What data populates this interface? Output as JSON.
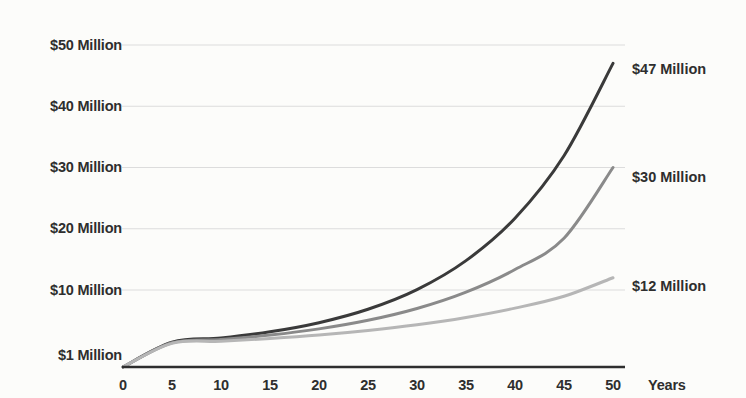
{
  "chart_data": {
    "type": "line",
    "title": "",
    "subtitle": "",
    "xlabel": "Years",
    "ylabel": "",
    "xlim": [
      0,
      50
    ],
    "ylim": [
      0,
      50
    ],
    "grid": true,
    "legend_position": "end-of-line",
    "x_ticks": [
      0,
      5,
      10,
      15,
      20,
      25,
      30,
      35,
      40,
      45,
      50
    ],
    "x_tick_labels": [
      "0",
      "5",
      "10",
      "15",
      "20",
      "25",
      "30",
      "35",
      "40",
      "45",
      "50"
    ],
    "y_ticks": [
      1,
      10,
      20,
      30,
      40,
      50
    ],
    "y_tick_labels": [
      "$1 Million",
      "$10 Million",
      "$20 Million",
      "$30 Million",
      "$40 Million",
      "$50 Million"
    ],
    "x": [
      0,
      5,
      10,
      15,
      20,
      25,
      30,
      35,
      40,
      45,
      50
    ],
    "series": [
      {
        "name": "$47 Million",
        "end_label": "$47 Million",
        "color": "#3a3a3a",
        "end_value": 47,
        "start_value": 1,
        "values": [
          1.0,
          1.47,
          2.16,
          3.17,
          4.66,
          6.85,
          10.06,
          14.79,
          21.72,
          31.92,
          47.0
        ]
      },
      {
        "name": "$30 Million",
        "end_label": "$30 Million",
        "color": "#8a8a8a",
        "end_value": 30,
        "start_value": 1,
        "values": [
          1.0,
          1.38,
          1.91,
          2.64,
          3.65,
          5.05,
          6.98,
          9.65,
          13.34,
          18.45,
          30.0
        ]
      },
      {
        "name": "$12 Million",
        "end_label": "$12 Million",
        "color": "#b6b6b6",
        "end_value": 12,
        "start_value": 1,
        "values": [
          1.0,
          1.28,
          1.63,
          2.08,
          2.65,
          3.39,
          4.32,
          5.52,
          7.04,
          8.98,
          12.0
        ]
      }
    ],
    "colors": {
      "background": "#fcfcfa",
      "gridline": "#dcdcdc",
      "baseline": "#2e2e2e",
      "text": "#2e2e2e"
    }
  }
}
